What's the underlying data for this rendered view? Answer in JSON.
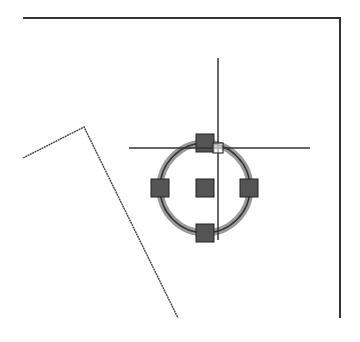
{
  "canvas": {
    "width": 360,
    "height": 342,
    "background": "#ffffff",
    "line_color": "#333333",
    "grip_fill": "#555555",
    "grip_stroke": "#222222",
    "highlight_color": "#9a9a9a"
  },
  "entities": {
    "border_polyline": {
      "points": "23,18 340,18 340,318"
    },
    "slanted_polyline": {
      "points": "23,158 84,127 178,318"
    },
    "circle": {
      "cx": 205,
      "cy": 188,
      "r": 45,
      "state": "selected"
    },
    "grips": [
      {
        "name": "quadrant-top",
        "x": 205,
        "y": 143
      },
      {
        "name": "quadrant-bottom",
        "x": 205,
        "y": 233
      },
      {
        "name": "quadrant-left",
        "x": 160,
        "y": 188
      },
      {
        "name": "quadrant-right",
        "x": 249,
        "y": 188
      },
      {
        "name": "center",
        "x": 205,
        "y": 188
      }
    ],
    "grip_size": 18
  },
  "cursor": {
    "type": "crosshair",
    "x": 218,
    "y": 148,
    "h_extent": [
      129,
      310
    ],
    "v_extent": [
      58,
      240
    ],
    "pickbox_size": 10
  }
}
